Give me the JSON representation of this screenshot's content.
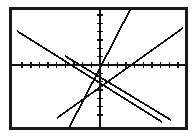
{
  "figure": {
    "name": "coordinate-plane-four-lines",
    "background": "#ffffff",
    "frame_color": "#1a1a1a",
    "axis_color": "#111111",
    "line_color": "#111111",
    "width": 196,
    "height": 137
  },
  "chart_data": {
    "type": "line",
    "title": "",
    "subtitle": "",
    "xlabel": "",
    "ylabel": "",
    "grid": false,
    "legend": null,
    "legend_position": "none",
    "xlim": [
      -10,
      10
    ],
    "ylim": [
      -7,
      7
    ],
    "x_ticks": [
      -9,
      -8,
      -7,
      -6,
      -5,
      -4,
      -3,
      -2,
      -1,
      1,
      2,
      3,
      4,
      5,
      6,
      7,
      8,
      9
    ],
    "y_ticks": [
      -6,
      -5,
      -4,
      -3,
      -2,
      -1,
      1,
      2,
      3,
      4,
      5,
      6
    ],
    "tick_labels_shown": false,
    "axes": {
      "x_axis_y_value": 0,
      "y_axis_x_value": 0,
      "x_axis_pixel_y": 65,
      "y_axis_pixel_x": 100
    },
    "series": [
      {
        "name": "line-descending-left",
        "description": "negative slope line from upper-left to lower-right",
        "slope": -0.55,
        "intercept": -1.2,
        "x": [
          -9.2,
          8.6
        ],
        "y": [
          3.9,
          -5.9
        ],
        "pixel_start": [
          17,
          31
        ],
        "pixel_end": [
          162,
          122
        ]
      },
      {
        "name": "line-steep-ascending",
        "description": "steep positive slope line rising to upper-right",
        "slope": 2.15,
        "intercept": -0.2,
        "x": [
          -3.2,
          3.0
        ],
        "y": [
          -7.0,
          6.3
        ],
        "pixel_start": [
          69,
          128
        ],
        "pixel_end": [
          130,
          10
        ]
      },
      {
        "name": "line-shallow-ascending",
        "description": "shallow positive slope line through lower-left to right edge",
        "slope": 0.72,
        "intercept": -2.3,
        "x": [
          -4.4,
          9.4
        ],
        "y": [
          -5.5,
          4.4
        ],
        "pixel_start": [
          57,
          118
        ],
        "pixel_end": [
          183,
          28
        ]
      },
      {
        "name": "line-descending-right",
        "description": "negative slope segment from near y-axis down to lower-right",
        "slope": -0.62,
        "intercept": -1.4,
        "x": [
          -3.6,
          7.2
        ],
        "y": [
          0.9,
          -5.8
        ],
        "pixel_start": [
          65,
          56
        ],
        "pixel_end": [
          171,
          120
        ]
      }
    ]
  }
}
